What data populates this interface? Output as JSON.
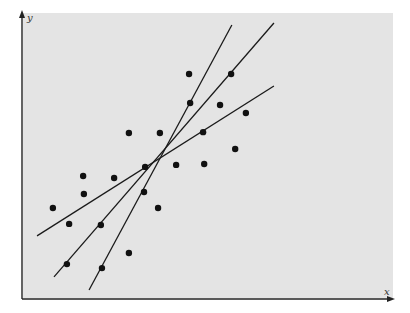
{
  "chart_data": {
    "type": "scatter",
    "title": "",
    "xlabel": "x",
    "ylabel": "y",
    "xlim": [
      0,
      10
    ],
    "ylim": [
      0,
      10
    ],
    "grid": false,
    "legend": null,
    "background_color": "#e4e4e4",
    "point_color": "#111111",
    "line_color": "#1a1a1a",
    "series": [
      {
        "name": "observations",
        "points": [
          {
            "x": 4.5,
            "y": 7.86
          },
          {
            "x": 5.64,
            "y": 7.86
          },
          {
            "x": 4.53,
            "y": 6.84
          },
          {
            "x": 5.34,
            "y": 6.77
          },
          {
            "x": 6.04,
            "y": 6.49
          },
          {
            "x": 2.87,
            "y": 5.79
          },
          {
            "x": 3.71,
            "y": 5.79
          },
          {
            "x": 4.88,
            "y": 5.82
          },
          {
            "x": 5.75,
            "y": 5.23
          },
          {
            "x": 3.31,
            "y": 4.6
          },
          {
            "x": 4.15,
            "y": 4.67
          },
          {
            "x": 4.91,
            "y": 4.7
          },
          {
            "x": 1.63,
            "y": 4.28
          },
          {
            "x": 2.47,
            "y": 4.21
          },
          {
            "x": 1.65,
            "y": 3.65
          },
          {
            "x": 3.28,
            "y": 3.72
          },
          {
            "x": 0.81,
            "y": 3.16
          },
          {
            "x": 3.66,
            "y": 3.16
          },
          {
            "x": 1.25,
            "y": 2.6
          },
          {
            "x": 2.11,
            "y": 2.56
          },
          {
            "x": 2.87,
            "y": 1.58
          },
          {
            "x": 1.19,
            "y": 1.19
          },
          {
            "x": 2.14,
            "y": 1.05
          }
        ]
      }
    ],
    "lines": [
      {
        "name": "fit-line-shallow",
        "x1": 0.38,
        "y1": 2.18,
        "x2": 6.8,
        "y2": 7.44
      },
      {
        "name": "fit-line-middle",
        "x1": 0.84,
        "y1": 0.74,
        "x2": 6.8,
        "y2": 9.65
      },
      {
        "name": "fit-line-steep",
        "x1": 1.79,
        "y1": 0.28,
        "x2": 5.66,
        "y2": 9.58
      }
    ]
  }
}
